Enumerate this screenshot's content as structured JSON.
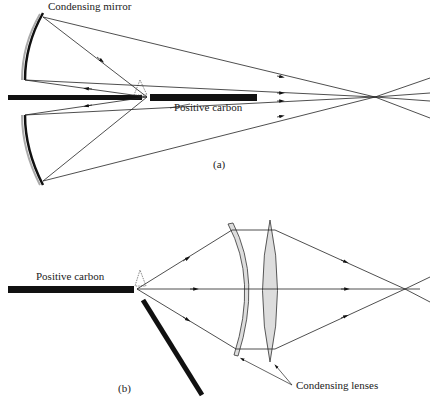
{
  "figure": {
    "panel_a": {
      "label": "(a)",
      "annotations": {
        "mirror": "Condensing mirror",
        "carbon": "Positive carbon"
      }
    },
    "panel_b": {
      "label": "(b)",
      "annotations": {
        "carbon": "Positive carbon",
        "lenses": "Condensing lenses"
      }
    }
  }
}
